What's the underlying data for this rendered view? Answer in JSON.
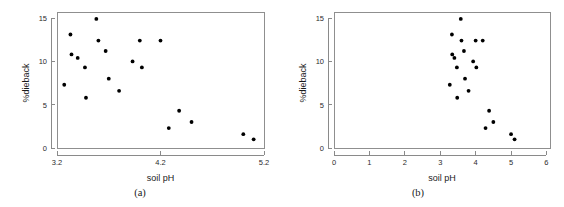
{
  "figure": {
    "panel_count": 2
  },
  "chart_data": [
    {
      "type": "scatter",
      "panel": "a",
      "caption": "(a)",
      "title": "",
      "xlabel": "soil pH",
      "ylabel": "%dieback",
      "xlim": [
        3.2,
        5.2
      ],
      "ylim": [
        0,
        15.7
      ],
      "xticks": [
        3.2,
        4.2,
        5.2
      ],
      "xticklabels": [
        "3.2",
        "4.2",
        "5.2"
      ],
      "yticks": [
        0,
        5,
        10,
        15
      ],
      "yticklabels": [
        "0",
        "5",
        "10",
        "15"
      ],
      "grid": false,
      "legend": "none",
      "marker": "filled-circle",
      "marker_color": "#000000",
      "n_points": 19,
      "x": [
        3.27,
        3.33,
        3.34,
        3.4,
        3.47,
        3.53,
        3.57,
        3.62,
        3.65,
        3.7,
        3.73,
        3.76,
        3.83,
        3.9,
        3.98,
        4.07,
        4.26,
        4.37,
        4.5,
        5.03,
        5.11
      ],
      "y": [
        7.3,
        13.1,
        10.8,
        10.4,
        9.3,
        5.8,
        14.9,
        12.4,
        11.2,
        8.0,
        6.6,
        10.0,
        9.3,
        12.4,
        2.3,
        4.3,
        3.0,
        1.6,
        1.0,
        0,
        0
      ],
      "points": [
        {
          "x": 3.27,
          "y": 7.3
        },
        {
          "x": 3.33,
          "y": 13.1
        },
        {
          "x": 3.34,
          "y": 10.8
        },
        {
          "x": 3.4,
          "y": 10.4
        },
        {
          "x": 3.47,
          "y": 9.3
        },
        {
          "x": 3.48,
          "y": 5.8
        },
        {
          "x": 3.58,
          "y": 14.9
        },
        {
          "x": 3.6,
          "y": 12.4
        },
        {
          "x": 3.67,
          "y": 11.2
        },
        {
          "x": 3.7,
          "y": 8.0
        },
        {
          "x": 3.8,
          "y": 6.6
        },
        {
          "x": 3.93,
          "y": 10.0
        },
        {
          "x": 4.02,
          "y": 9.3
        },
        {
          "x": 4.0,
          "y": 12.4
        },
        {
          "x": 4.2,
          "y": 12.4
        },
        {
          "x": 4.28,
          "y": 2.3
        },
        {
          "x": 4.38,
          "y": 4.3
        },
        {
          "x": 4.5,
          "y": 3.0
        },
        {
          "x": 5.0,
          "y": 1.6
        },
        {
          "x": 5.1,
          "y": 1.0
        }
      ]
    },
    {
      "type": "scatter",
      "panel": "b",
      "caption": "(b)",
      "title": "",
      "xlabel": "soil pH",
      "ylabel": "%dieback",
      "xlim": [
        0,
        6.1
      ],
      "ylim": [
        0,
        15.7
      ],
      "xticks": [
        0,
        1,
        2,
        3,
        4,
        5,
        6
      ],
      "xticklabels": [
        "0",
        "1",
        "2",
        "3",
        "4",
        "5",
        "6"
      ],
      "yticks": [
        0,
        5,
        10,
        15
      ],
      "yticklabels": [
        "0",
        "5",
        "10",
        "15"
      ],
      "grid": false,
      "legend": "none",
      "marker": "filled-circle",
      "marker_color": "#000000",
      "n_points": 19,
      "points": [
        {
          "x": 3.27,
          "y": 7.3
        },
        {
          "x": 3.33,
          "y": 13.1
        },
        {
          "x": 3.34,
          "y": 10.8
        },
        {
          "x": 3.4,
          "y": 10.4
        },
        {
          "x": 3.47,
          "y": 9.3
        },
        {
          "x": 3.48,
          "y": 5.8
        },
        {
          "x": 3.58,
          "y": 14.9
        },
        {
          "x": 3.6,
          "y": 12.4
        },
        {
          "x": 3.67,
          "y": 11.2
        },
        {
          "x": 3.7,
          "y": 8.0
        },
        {
          "x": 3.8,
          "y": 6.6
        },
        {
          "x": 3.93,
          "y": 10.0
        },
        {
          "x": 4.02,
          "y": 9.3
        },
        {
          "x": 4.0,
          "y": 12.4
        },
        {
          "x": 4.2,
          "y": 12.4
        },
        {
          "x": 4.28,
          "y": 2.3
        },
        {
          "x": 4.38,
          "y": 4.3
        },
        {
          "x": 4.5,
          "y": 3.0
        },
        {
          "x": 5.0,
          "y": 1.6
        },
        {
          "x": 5.1,
          "y": 1.0
        }
      ]
    }
  ]
}
